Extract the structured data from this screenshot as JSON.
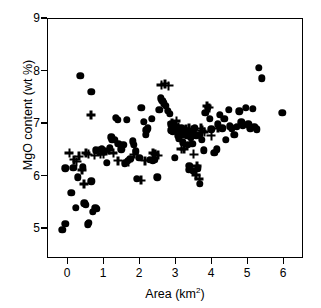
{
  "chart_data": {
    "type": "scatter",
    "title": "",
    "xlabel": "Area (km²)",
    "ylabel": "MgO content (wt %)",
    "xlim": [
      -0.35,
      6.75
    ],
    "ylim": [
      4.55,
      9.12
    ],
    "xticks": [
      0,
      1,
      2,
      3,
      4,
      5,
      6
    ],
    "xtick_labels": [
      "0",
      "1",
      "2",
      "3",
      "4",
      "5",
      "6"
    ],
    "yticks": [
      5,
      6,
      7,
      8,
      9
    ],
    "ytick_labels": [
      "5",
      "6",
      "7",
      "8",
      "9"
    ],
    "grid": false,
    "legend": "none",
    "series": [
      {
        "name": "filled-circle",
        "marker": "circle",
        "color": "#000000",
        "points": [
          [
            0.05,
            5.07
          ],
          [
            0.13,
            5.19
          ],
          [
            0.13,
            6.25
          ],
          [
            0.36,
            6.26
          ],
          [
            0.3,
            5.78
          ],
          [
            0.42,
            5.5
          ],
          [
            0.48,
            6.08
          ],
          [
            0.55,
            8.03
          ],
          [
            0.62,
            6.27
          ],
          [
            0.66,
            5.58
          ],
          [
            0.7,
            5.55
          ],
          [
            0.76,
            5.18
          ],
          [
            0.79,
            5.21
          ],
          [
            0.86,
            7.72
          ],
          [
            0.86,
            6.0
          ],
          [
            0.9,
            5.42
          ],
          [
            0.97,
            5.5
          ],
          [
            0.98,
            6.6
          ],
          [
            1.02,
            5.47
          ],
          [
            1.15,
            6.62
          ],
          [
            1.23,
            6.59
          ],
          [
            1.3,
            6.36
          ],
          [
            1.38,
            6.65
          ],
          [
            1.42,
            6.85
          ],
          [
            1.45,
            6.8
          ],
          [
            1.52,
            6.8
          ],
          [
            1.55,
            7.22
          ],
          [
            1.6,
            7.18
          ],
          [
            1.62,
            6.72
          ],
          [
            1.7,
            6.62
          ],
          [
            1.76,
            6.7
          ],
          [
            1.8,
            6.35
          ],
          [
            1.85,
            7.18
          ],
          [
            1.88,
            6.4
          ],
          [
            1.95,
            6.43
          ],
          [
            2.02,
            6.77
          ],
          [
            2.05,
            6.7
          ],
          [
            2.1,
            6.58
          ],
          [
            2.14,
            6.05
          ],
          [
            2.2,
            6.45
          ],
          [
            2.26,
            7.42
          ],
          [
            2.33,
            7.15
          ],
          [
            2.38,
            6.9
          ],
          [
            2.4,
            6.98
          ],
          [
            2.44,
            7.02
          ],
          [
            2.5,
            6.42
          ],
          [
            2.55,
            7.2
          ],
          [
            2.58,
            6.4
          ],
          [
            2.62,
            6.42
          ],
          [
            2.7,
            6.08
          ],
          [
            2.76,
            7.38
          ],
          [
            2.8,
            7.6
          ],
          [
            2.84,
            7.55
          ],
          [
            2.88,
            7.5
          ],
          [
            2.95,
            7.45
          ],
          [
            3.0,
            7.36
          ],
          [
            3.05,
            7.3
          ],
          [
            3.08,
            7.1
          ],
          [
            3.1,
            6.98
          ],
          [
            3.14,
            6.95
          ],
          [
            3.18,
            7.05
          ],
          [
            3.2,
            6.45
          ],
          [
            3.22,
            6.99
          ],
          [
            3.25,
            7.05
          ],
          [
            3.28,
            6.88
          ],
          [
            3.3,
            6.82
          ],
          [
            3.34,
            7.0
          ],
          [
            3.38,
            7.02
          ],
          [
            3.4,
            6.9
          ],
          [
            3.42,
            6.75
          ],
          [
            3.46,
            6.92
          ],
          [
            3.5,
            6.96
          ],
          [
            3.54,
            6.88
          ],
          [
            3.56,
            6.7
          ],
          [
            3.58,
            6.22
          ],
          [
            3.6,
            6.3
          ],
          [
            3.62,
            6.95
          ],
          [
            3.65,
            6.85
          ],
          [
            3.68,
            6.72
          ],
          [
            3.7,
            6.2
          ],
          [
            3.72,
            6.92
          ],
          [
            3.76,
            7.02
          ],
          [
            3.8,
            6.88
          ],
          [
            3.84,
            6.25
          ],
          [
            3.88,
            6.9
          ],
          [
            3.9,
            5.96
          ],
          [
            3.95,
            6.8
          ],
          [
            4.0,
            6.6
          ],
          [
            4.05,
            7.32
          ],
          [
            4.12,
            7.42
          ],
          [
            4.18,
            7.2
          ],
          [
            4.22,
            7.0
          ],
          [
            4.3,
            6.55
          ],
          [
            4.36,
            6.62
          ],
          [
            4.4,
            7.1
          ],
          [
            4.45,
            7.28
          ],
          [
            4.52,
            7.02
          ],
          [
            4.58,
            7.2
          ],
          [
            4.62,
            6.8
          ],
          [
            4.7,
            7.38
          ],
          [
            4.74,
            7.06
          ],
          [
            4.78,
            7.02
          ],
          [
            4.86,
            6.9
          ],
          [
            4.92,
            7.05
          ],
          [
            5.0,
            7.35
          ],
          [
            5.05,
            7.14
          ],
          [
            5.1,
            7.08
          ],
          [
            5.18,
            7.42
          ],
          [
            5.25,
            7.1
          ],
          [
            5.3,
            7.02
          ],
          [
            5.38,
            7.4
          ],
          [
            5.42,
            7.05
          ],
          [
            5.48,
            7.0
          ],
          [
            5.55,
            8.18
          ],
          [
            5.62,
            7.98
          ],
          [
            6.2,
            7.32
          ]
        ]
      },
      {
        "name": "plus-cross",
        "marker": "plus",
        "color": "#000000",
        "points": [
          [
            0.25,
            6.55
          ],
          [
            0.38,
            6.42
          ],
          [
            0.45,
            6.38
          ],
          [
            0.52,
            6.48
          ],
          [
            0.6,
            6.22
          ],
          [
            0.66,
            5.95
          ],
          [
            0.72,
            6.55
          ],
          [
            0.78,
            6.52
          ],
          [
            0.86,
            7.28
          ],
          [
            0.95,
            6.5
          ],
          [
            1.06,
            6.58
          ],
          [
            1.12,
            6.52
          ],
          [
            1.2,
            6.53
          ],
          [
            1.35,
            6.6
          ],
          [
            1.48,
            6.55
          ],
          [
            1.6,
            6.4
          ],
          [
            1.9,
            6.38
          ],
          [
            2.05,
            6.52
          ],
          [
            2.25,
            6.02
          ],
          [
            2.36,
            6.4
          ],
          [
            2.58,
            6.55
          ],
          [
            2.64,
            6.52
          ],
          [
            2.72,
            6.5
          ],
          [
            2.82,
            7.85
          ],
          [
            2.92,
            7.88
          ],
          [
            3.02,
            7.84
          ],
          [
            3.12,
            7.12
          ],
          [
            3.18,
            7.02
          ],
          [
            3.24,
            7.16
          ],
          [
            3.3,
            7.05
          ],
          [
            3.34,
            6.9
          ],
          [
            3.38,
            6.62
          ],
          [
            3.42,
            6.98
          ],
          [
            3.46,
            6.62
          ],
          [
            3.5,
            7.0
          ],
          [
            3.56,
            6.95
          ],
          [
            3.6,
            7.02
          ],
          [
            3.66,
            6.98
          ],
          [
            3.72,
            6.52
          ],
          [
            3.78,
            6.12
          ],
          [
            3.82,
            6.3
          ],
          [
            3.88,
            6.05
          ],
          [
            3.92,
            7.02
          ],
          [
            3.96,
            6.98
          ],
          [
            4.02,
            6.95
          ],
          [
            4.1,
            7.45
          ],
          [
            4.15,
            7.42
          ],
          [
            4.22,
            6.88
          ],
          [
            4.4,
            7.02
          ]
        ]
      }
    ]
  },
  "axis": {
    "x_label": "Area (km²)",
    "x_label_base": "Area (km",
    "x_label_sup": "2",
    "x_label_close": ")",
    "y_label": "MgO content (wt %)"
  }
}
